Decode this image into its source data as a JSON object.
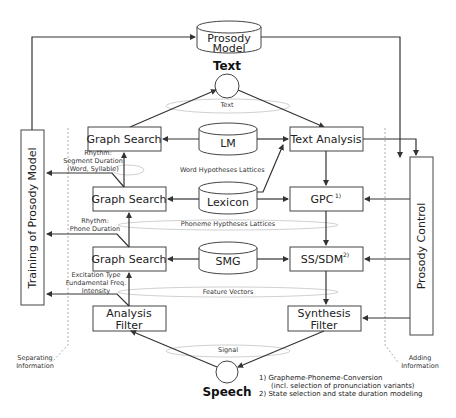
{
  "diagram": {
    "nodes": {
      "prosody_model": "Prosody",
      "prosody_model_2": "Model",
      "text_io": "Text",
      "speech_io": "Speech",
      "graph_search_1": "Graph Search",
      "graph_search_2": "Graph Search",
      "graph_search_3": "Graph Search",
      "lm": "LM",
      "lexicon": "Lexicon",
      "smg": "SMG",
      "text_analysis": "Text Analysis",
      "gpc": "GPC",
      "gpc_sup": "1)",
      "ss_sdm": "SS/SDM",
      "ss_sdm_sup": "2)",
      "analysis_filter_1": "Analysis",
      "analysis_filter_2": "Filter",
      "synthesis_filter_1": "Synthesis",
      "synthesis_filter_2": "Filter",
      "training": "Training of Prosody Model",
      "prosody_control": "Prosody Control"
    },
    "level_labels": {
      "text": "Text",
      "word_lattices": "Word Hypotheses Lattices",
      "phoneme_lattices": "Phoneme Hyptheses Lattices",
      "feature_vectors": "Feature Vectors",
      "signal": "Signal"
    },
    "side_labels": {
      "rhythm_segment_1": "Rhythm:",
      "rhythm_segment_2": "Segment Duration",
      "rhythm_segment_3": "(Word, Syllable)",
      "rhythm_phone_1": "Rhythm:",
      "rhythm_phone_2": "Phone Duration",
      "excitation_1": "Excitation Type",
      "excitation_2": "Fundamental Freq.",
      "excitation_3": "Intensity",
      "separating_1": "Separating",
      "separating_2": "Information",
      "adding_1": "Adding",
      "adding_2": "Information"
    },
    "footnotes": {
      "fn1_a": "1) Grapheme-Phoneme-Conversion",
      "fn1_b": "(incl. selection of pronunciation variants)",
      "fn2": "2) State selection and state duration modeling"
    }
  }
}
